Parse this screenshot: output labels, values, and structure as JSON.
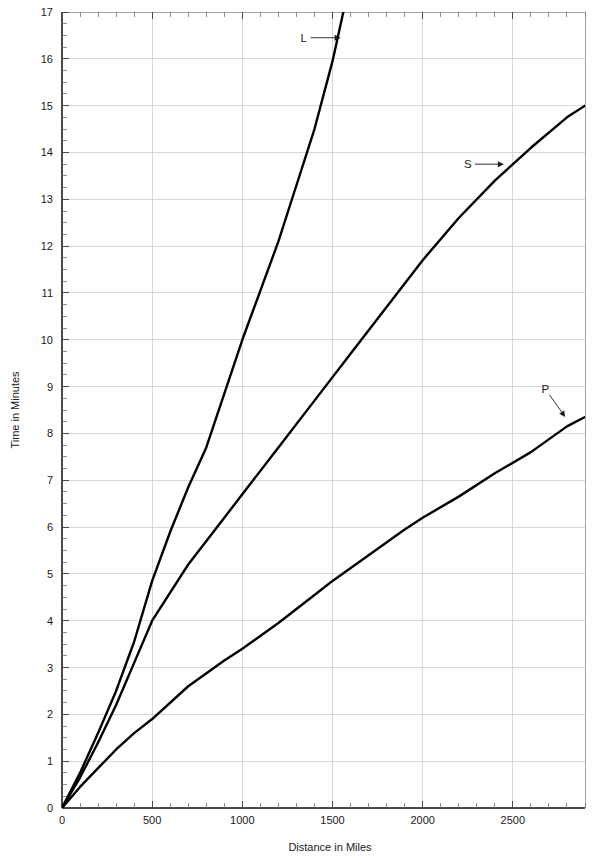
{
  "chart_data": {
    "type": "line",
    "title": "",
    "xlabel": "Distance in Miles",
    "ylabel": "Time in Minutes",
    "xlim": [
      0,
      2900
    ],
    "ylim": [
      0,
      17
    ],
    "x_ticks": [
      0,
      500,
      1000,
      1500,
      2000,
      2500
    ],
    "x_tick_labels": [
      "0",
      "500",
      "1000",
      "1500",
      "2000",
      "2500"
    ],
    "x_minor_step": 100,
    "y_ticks": [
      0,
      1,
      2,
      3,
      4,
      5,
      6,
      7,
      8,
      9,
      10,
      11,
      12,
      13,
      14,
      15,
      16,
      17
    ],
    "y_tick_labels": [
      "0",
      "1",
      "2",
      "3",
      "4",
      "5",
      "6",
      "7",
      "8",
      "9",
      "10",
      "11",
      "12",
      "13",
      "14",
      "15",
      "16",
      "17"
    ],
    "y_minor_step": 0.25,
    "grid": true,
    "grid_x_step": 500,
    "grid_y_step": 1,
    "legend_position": "inline-annotations",
    "line_color": "#000000",
    "grid_color": "#c8c8c8",
    "axis_color": "#4a4a4a",
    "series": [
      {
        "name": "L",
        "label": "L",
        "label_x": 1340,
        "label_y": 16.45,
        "arrow_to_x": 1545,
        "arrow_to_y": 16.45,
        "x": [
          0,
          100,
          200,
          300,
          400,
          500,
          600,
          700,
          800,
          900,
          1000,
          1100,
          1200,
          1300,
          1400,
          1500,
          1560
        ],
        "y": [
          0,
          0.75,
          1.6,
          2.5,
          3.55,
          4.85,
          5.9,
          6.85,
          7.7,
          8.85,
          10.0,
          11.05,
          12.1,
          13.3,
          14.5,
          15.95,
          17.0
        ]
      },
      {
        "name": "S",
        "label": "S",
        "label_x": 2250,
        "label_y": 13.75,
        "arrow_to_x": 2450,
        "arrow_to_y": 13.75,
        "x": [
          0,
          100,
          200,
          300,
          400,
          500,
          700,
          900,
          1000,
          1200,
          1400,
          1600,
          1800,
          2000,
          2200,
          2400,
          2600,
          2800,
          2900
        ],
        "y": [
          0,
          0.65,
          1.4,
          2.2,
          3.1,
          4.0,
          5.2,
          6.2,
          6.7,
          7.7,
          8.7,
          9.7,
          10.7,
          11.7,
          12.6,
          13.4,
          14.1,
          14.75,
          15.0
        ]
      },
      {
        "name": "P",
        "label": "P",
        "label_x": 2680,
        "label_y": 8.95,
        "arrow_to_x": 2790,
        "arrow_to_y": 8.35,
        "x": [
          0,
          100,
          200,
          300,
          400,
          500,
          700,
          900,
          1000,
          1200,
          1400,
          1500,
          1700,
          1900,
          2000,
          2200,
          2400,
          2600,
          2800,
          2900
        ],
        "y": [
          0,
          0.45,
          0.85,
          1.25,
          1.6,
          1.9,
          2.6,
          3.15,
          3.4,
          3.95,
          4.55,
          4.85,
          5.4,
          5.95,
          6.2,
          6.65,
          7.15,
          7.6,
          8.15,
          8.35
        ]
      }
    ]
  }
}
